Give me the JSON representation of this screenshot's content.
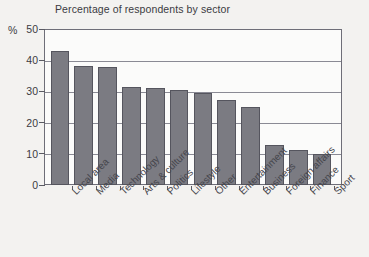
{
  "chart_data": {
    "type": "bar",
    "title": "Percentage of respondents by sector",
    "xlabel": "",
    "ylabel": "%",
    "ylim": [
      0,
      50
    ],
    "yticks": [
      0,
      10,
      20,
      30,
      40,
      50
    ],
    "grid": true,
    "legend": false,
    "orientation": "vertical",
    "bar_color": "#7b7b82",
    "bar_edge_color": "#55555e",
    "categories": [
      "Local area",
      "Media",
      "Technology",
      "Arts & culture",
      "Politics",
      "Lifestyle",
      "Other",
      "Entertainment",
      "Business",
      "Foreign affairs",
      "Finance",
      "Sport"
    ],
    "values": [
      43,
      38,
      37.8,
      31.5,
      31,
      30.6,
      29.5,
      27.4,
      25.1,
      12.8,
      11.3,
      9.8
    ]
  },
  "axis": {
    "unit_label": "%",
    "tick_labels": [
      "50",
      "40",
      "30",
      "20",
      "10",
      "0"
    ]
  }
}
